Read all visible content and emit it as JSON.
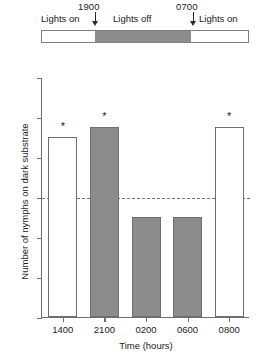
{
  "photoperiod": {
    "segments": [
      {
        "label": "Lights on",
        "state": "light"
      },
      {
        "label": "Lights off",
        "state": "dark"
      },
      {
        "label": "Lights on",
        "state": "light"
      }
    ],
    "markers": [
      {
        "time": "1900",
        "meaning": "lights-off-onset"
      },
      {
        "time": "0700",
        "meaning": "lights-on-onset"
      }
    ],
    "colors": {
      "dark": "#8c8c8c",
      "light": "#ffffff",
      "outline": "#808080"
    }
  },
  "chart_data": {
    "type": "bar",
    "title": "",
    "xlabel": "Time (hours)",
    "ylabel": "Number of nymphs on dark substrate",
    "categories": [
      "1400",
      "2100",
      "0200",
      "0600",
      "0800"
    ],
    "values": [
      18,
      19,
      10,
      10,
      19
    ],
    "bar_styles": [
      "open",
      "filled",
      "filled",
      "filled",
      "open"
    ],
    "significance": [
      "*",
      "*",
      "",
      "",
      "*"
    ],
    "ylim": [
      0,
      24
    ],
    "yticks": [
      0,
      4,
      8,
      12,
      16,
      20,
      24
    ],
    "xticks": [
      "1400",
      "2100",
      "0200",
      "0600",
      "0800"
    ],
    "grid": false,
    "legend": null,
    "annotations": [
      {
        "type": "reference-line",
        "style": "dashed",
        "y": 12,
        "label": ""
      }
    ],
    "colors": {
      "filled_bar": "#8c8c8c",
      "open_bar": "#ffffff",
      "axis": "#6e6e6e"
    }
  }
}
